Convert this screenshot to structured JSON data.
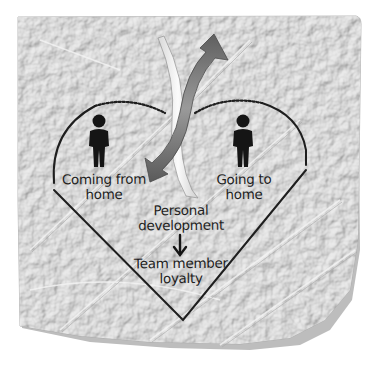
{
  "diagram": {
    "type": "heart-diagram-on-paper",
    "labels": {
      "left_figure": [
        "Coming from",
        "home"
      ],
      "right_figure": [
        "Going to",
        "home"
      ],
      "center_top": [
        "Personal",
        "development"
      ],
      "center_bottom": [
        "Team member",
        "loyalty"
      ]
    },
    "icons": {
      "left_person": "person-icon",
      "right_person": "person-icon",
      "down_arrow": "arrow-down-icon",
      "curved_arrow_dark": "curved-arrow-up-icon",
      "curved_arrow_light": "curved-arrow-down-icon"
    },
    "colors": {
      "background": "#ffffff",
      "paper": "#dcdcdc",
      "paper_shadow": "#b8b8b8",
      "ink": "#1e1e1e",
      "arrow_dark": "#7a7a7a",
      "arrow_light": "#f2f2f2"
    }
  }
}
